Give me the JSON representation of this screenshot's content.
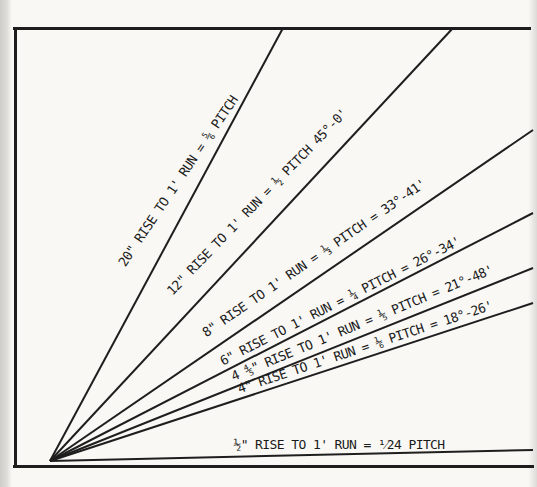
{
  "diagram": {
    "type": "roof-pitch-fan-chart",
    "ink_color": "#1e1e1e",
    "paper_color": "#f9f8f5",
    "origin": {
      "x": 50,
      "y": 461
    },
    "frame": {
      "top": {
        "x": 13,
        "y": 26.5,
        "length": 518,
        "thickness": 3,
        "orientation": "horizontal"
      },
      "left": {
        "x": 13.5,
        "y": 26.5,
        "length": 441,
        "thickness": 3,
        "orientation": "vertical"
      },
      "bottom": {
        "x": 13,
        "y": 464.5,
        "length": 521,
        "thickness": 3.5,
        "orientation": "horizontal"
      }
    },
    "lines": [
      {
        "name": "20-inch-rise",
        "label": "20\" RISE TO 1' RUN = ⅚ PITCH",
        "rise": "20\"",
        "pitch": "5/6",
        "angle": "",
        "x2": 283,
        "y2": 28
      },
      {
        "name": "12-inch-rise",
        "label": "12\" RISE TO 1' RUN = ½ PITCH 45°-0'",
        "rise": "12\"",
        "pitch": "1/2",
        "angle": "45°-0'",
        "x2": 453,
        "y2": 28
      },
      {
        "name": "8-inch-rise",
        "label": "8\" RISE TO 1' RUN = ⅓ PITCH = 33°-41'",
        "rise": "8\"",
        "pitch": "1/3",
        "angle": "33°-41'",
        "x2": 533,
        "y2": 130
      },
      {
        "name": "6-inch-rise",
        "label": "6\" RISE TO 1' RUN = ¼ PITCH = 26°-34'",
        "rise": "6\"",
        "pitch": "1/4",
        "angle": "26°-34'",
        "x2": 533,
        "y2": 213
      },
      {
        "name": "4-4-5-inch-rise",
        "label": "4 ⅘\" RISE TO 1' RUN = ⅕ PITCH = 21°-48'",
        "rise": "4 4/5\"",
        "pitch": "1/5",
        "angle": "21°-48'",
        "x2": 533,
        "y2": 268
      },
      {
        "name": "4-inch-rise",
        "label": "4\" RISE TO 1' RUN = ⅙ PITCH = 18°-26'",
        "rise": "4\"",
        "pitch": "1/6",
        "angle": "18°-26'",
        "x2": 533,
        "y2": 303
      },
      {
        "name": "half-inch-rise",
        "label": "½\" RISE TO 1' RUN = ¹⁄24 PITCH",
        "rise": "1/2\"",
        "pitch": "1/24",
        "angle": "",
        "x2": 533,
        "y2": 450
      }
    ]
  }
}
